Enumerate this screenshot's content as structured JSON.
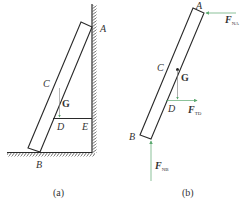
{
  "figure": {
    "panel_a": {
      "caption": "(a)",
      "labels": {
        "A": "A",
        "B": "B",
        "C": "C",
        "D": "D",
        "E": "E",
        "G": "G"
      }
    },
    "panel_b": {
      "caption": "(b)",
      "labels": {
        "A": "A",
        "B": "B",
        "C": "C",
        "D": "D",
        "G": "G"
      },
      "forces": {
        "FNA": {
          "main": "F",
          "sub": "NA"
        },
        "FTD": {
          "main": "F",
          "sub": "TD"
        },
        "FNB": {
          "main": "F",
          "sub": "NB"
        }
      }
    },
    "colors": {
      "line": "#2a2a2a",
      "arrow": "#5aa86e",
      "text": "#333333"
    }
  }
}
